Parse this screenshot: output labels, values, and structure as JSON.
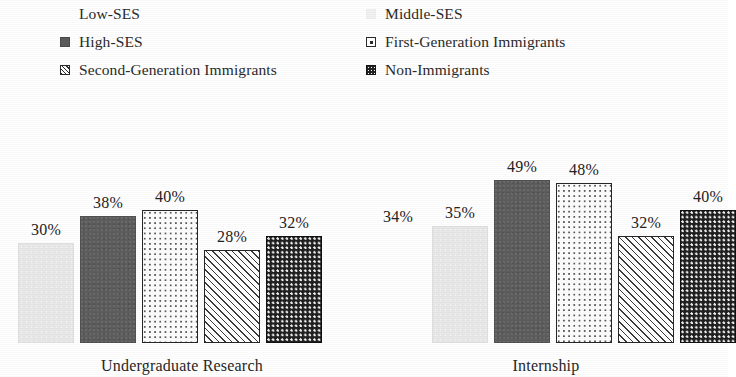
{
  "chart_data": {
    "type": "bar",
    "title": "",
    "xlabel": "",
    "ylabel": "",
    "ylim": [
      0,
      60
    ],
    "grid": false,
    "legend_position": "top",
    "categories": [
      "Undergraduate Research",
      "Internship"
    ],
    "series": [
      {
        "name": "Low-SES",
        "values": [
          28,
          34
        ],
        "labels": [
          "28%",
          "34%"
        ],
        "pattern": "white",
        "swatch": "sw-white"
      },
      {
        "name": "Middle-SES",
        "values": [
          30,
          35
        ],
        "labels": [
          "30%",
          "35%"
        ],
        "pattern": "lightspeck",
        "swatch": "sw-lightspeck"
      },
      {
        "name": "High-SES",
        "values": [
          38,
          49
        ],
        "labels": [
          "38%",
          "49%"
        ],
        "pattern": "darkgray",
        "swatch": "sw-darkgray"
      },
      {
        "name": "First-Generation Immigrants",
        "values": [
          40,
          48
        ],
        "labels": [
          "40%",
          "48%"
        ],
        "pattern": "dotopen",
        "swatch": "sw-dotopen"
      },
      {
        "name": "Second-Generation Immigrants",
        "values": [
          28,
          32
        ],
        "labels": [
          "28%",
          "32%"
        ],
        "pattern": "hatch",
        "swatch": "sw-hatch"
      },
      {
        "name": "Non-Immigrants",
        "values": [
          32,
          40
        ],
        "labels": [
          "32%",
          "40%"
        ],
        "pattern": "darkdot",
        "swatch": "sw-darkdot"
      }
    ],
    "colors": {
      "low_ses": "#ffffff",
      "middle_ses": "#e8e8e8",
      "high_ses": "#5d5d5d",
      "first_generation": "#ffffff",
      "second_generation": "#ffffff",
      "non_immigrants": "#202020",
      "text": "#232323",
      "background": "#ffffff"
    }
  },
  "legend": {
    "columns": [
      {
        "items": [
          {
            "label": "Low-SES",
            "swatch": "sw-white"
          },
          {
            "label": "High-SES",
            "swatch": "sw-darkgray"
          },
          {
            "label": "Second-Generation Immigrants",
            "swatch": "sw-hatch"
          }
        ]
      },
      {
        "items": [
          {
            "label": "Middle-SES",
            "swatch": "sw-lightspeck"
          },
          {
            "label": "First-Generation Immigrants",
            "swatch": "sw-dotopen"
          },
          {
            "label": "Non-Immigrants",
            "swatch": "sw-darkdot"
          }
        ]
      }
    ]
  },
  "groups": [
    {
      "label": "Undergraduate Research"
    },
    {
      "label": "Internship"
    }
  ]
}
